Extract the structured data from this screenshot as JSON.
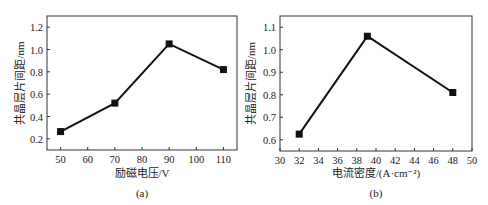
{
  "chart_data": [
    {
      "type": "line",
      "panel_label": "(a)",
      "title": "",
      "xlabel": "励磁电压/V",
      "ylabel": "共晶层片间距/nm",
      "x": [
        50,
        70,
        90,
        110
      ],
      "series": [
        {
          "name": "共晶层片间距",
          "values": [
            0.265,
            0.52,
            1.05,
            0.82
          ]
        }
      ],
      "xticks": [
        50,
        60,
        70,
        80,
        90,
        100,
        110
      ],
      "yticks": [
        0.2,
        0.4,
        0.6,
        0.8,
        1.0,
        1.2
      ],
      "xlim": [
        45,
        115
      ],
      "ylim": [
        0.1,
        1.3
      ],
      "marker": "square",
      "grid": false,
      "legend": "none"
    },
    {
      "type": "line",
      "panel_label": "(b)",
      "title": "",
      "xlabel": "电流密度/(A·cm⁻²)",
      "ylabel": "共晶层片间距/nm",
      "x": [
        32,
        39.1,
        48
      ],
      "series": [
        {
          "name": "共晶层片间距",
          "values": [
            0.625,
            1.06,
            0.81
          ]
        }
      ],
      "xticks": [
        30,
        32,
        34,
        36,
        38,
        40,
        42,
        44,
        46,
        48,
        50
      ],
      "yticks": [
        0.6,
        0.7,
        0.8,
        0.9,
        1.0,
        1.1
      ],
      "xlim": [
        30,
        50
      ],
      "ylim": [
        0.55,
        1.15
      ],
      "marker": "square",
      "grid": false,
      "legend": "none"
    }
  ],
  "panels": {
    "a": {
      "caption": "(a)",
      "xlabel": "励磁电压/V",
      "ylabel": "共晶层片间距/nm",
      "xtick_labels": [
        "50",
        "60",
        "70",
        "80",
        "90",
        "100",
        "110"
      ],
      "ytick_labels": [
        "0.2",
        "0.4",
        "0.6",
        "0.8",
        "1.0",
        "1.2"
      ]
    },
    "b": {
      "caption": "(b)",
      "xlabel": "电流密度/(A·cm⁻²)",
      "ylabel": "共晶层片间距/nm",
      "xtick_labels": [
        "30",
        "32",
        "34",
        "36",
        "38",
        "40",
        "42",
        "44",
        "46",
        "48",
        "50"
      ],
      "ytick_labels": [
        "0.6",
        "0.7",
        "0.8",
        "0.9",
        "1.0",
        "1.1"
      ]
    }
  },
  "colors": {
    "line": "#111111",
    "axis": "#333333",
    "text": "#222222"
  }
}
